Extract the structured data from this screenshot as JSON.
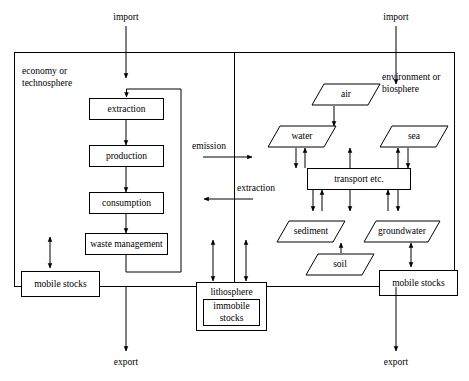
{
  "diagram": {
    "regions": [
      {
        "id": "economy",
        "label_line1": "economy or",
        "label_line2": "technosphere"
      },
      {
        "id": "environment",
        "label_line1": "environment or",
        "label_line2": "biosphere"
      }
    ],
    "external_flows": [
      {
        "id": "import-economy",
        "label": "import"
      },
      {
        "id": "import-environment",
        "label": "import"
      },
      {
        "id": "export-economy",
        "label": "export"
      },
      {
        "id": "export-environment",
        "label": "export"
      }
    ],
    "cross_flows": [
      {
        "id": "emission",
        "label": "emission",
        "direction": "economy-to-environment"
      },
      {
        "id": "extraction",
        "label": "extraction",
        "direction": "environment-to-economy"
      }
    ],
    "economy_nodes": [
      {
        "id": "extraction-process",
        "label": "extraction",
        "shape": "rectangle"
      },
      {
        "id": "production",
        "label": "production",
        "shape": "rectangle"
      },
      {
        "id": "consumption",
        "label": "consumption",
        "shape": "rectangle"
      },
      {
        "id": "waste-management",
        "label": "waste management",
        "shape": "rectangle"
      },
      {
        "id": "mobile-stocks-economy",
        "label": "mobile stocks",
        "shape": "rectangle"
      }
    ],
    "environment_nodes": [
      {
        "id": "air",
        "label": "air",
        "shape": "parallelogram"
      },
      {
        "id": "water",
        "label": "water",
        "shape": "parallelogram"
      },
      {
        "id": "sea",
        "label": "sea",
        "shape": "parallelogram"
      },
      {
        "id": "transport",
        "label": "transport etc.",
        "shape": "rectangle"
      },
      {
        "id": "sediment",
        "label": "sediment",
        "shape": "parallelogram"
      },
      {
        "id": "groundwater",
        "label": "groundwater",
        "shape": "parallelogram"
      },
      {
        "id": "soil",
        "label": "soil",
        "shape": "parallelogram"
      },
      {
        "id": "mobile-stocks-environment",
        "label": "mobile stocks",
        "shape": "rectangle"
      }
    ],
    "shared_nodes": [
      {
        "id": "lithosphere",
        "label": "lithosphere",
        "shape": "rectangle"
      },
      {
        "id": "immobile-stocks",
        "label_line1": "immobile",
        "label_line2": "stocks",
        "shape": "rectangle"
      }
    ],
    "colors": {
      "stroke": "#000000",
      "fill": "#ffffff",
      "background": "#ffffff"
    }
  }
}
